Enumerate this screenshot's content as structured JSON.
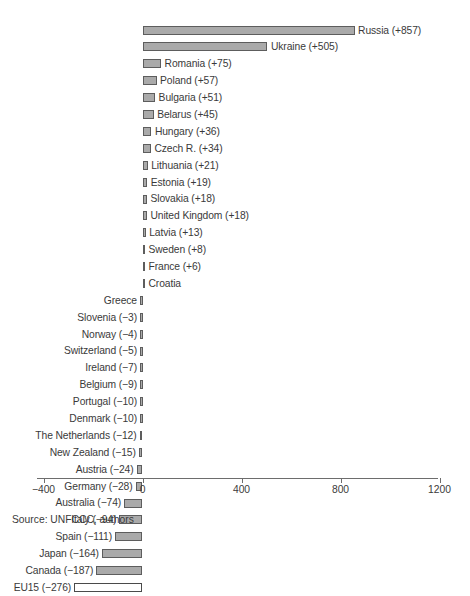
{
  "chart_data": {
    "type": "bar",
    "orientation": "horizontal",
    "title": "",
    "subtitle": "",
    "xlabel": "",
    "ylabel": "",
    "xlim": [
      -400,
      1200
    ],
    "xticks": [
      -400,
      0,
      400,
      800,
      1200
    ],
    "xtick_labels": [
      "−400",
      "0",
      "400",
      "800",
      "1200"
    ],
    "grid": false,
    "legend": null,
    "source_note": "Source: UNFCCC, authors",
    "zero_baseline": 0,
    "categories": [
      "Russia",
      "Ukraine",
      "Romania",
      "Poland",
      "Bulgaria",
      "Belarus",
      "Hungary",
      "Czech R.",
      "Lithuania",
      "Estonia",
      "Slovakia",
      "United Kingdom",
      "Latvia",
      "Sweden",
      "France",
      "Croatia",
      "Greece",
      "Slovenia",
      "Norway",
      "Switzerland",
      "Ireland",
      "Belgium",
      "Portugal",
      "Denmark",
      "The Netherlands",
      "New Zealand",
      "Austria",
      "Germany",
      "Australia",
      "Italy",
      "Spain",
      "Japan",
      "Canada",
      "EU15"
    ],
    "values": [
      857,
      505,
      75,
      57,
      51,
      45,
      36,
      34,
      21,
      19,
      18,
      18,
      13,
      8,
      6,
      2,
      -1,
      -3,
      -4,
      -5,
      -7,
      -9,
      -10,
      -10,
      -12,
      -15,
      -24,
      -28,
      -74,
      -94,
      -111,
      -164,
      -187,
      -276
    ],
    "bars": [
      {
        "name": "Russia",
        "value": 857,
        "label": "Russia (+857)",
        "side": "right",
        "style": "filled"
      },
      {
        "name": "Ukraine",
        "value": 505,
        "label": "Ukraine (+505)",
        "side": "right",
        "style": "filled"
      },
      {
        "name": "Romania",
        "value": 75,
        "label": "Romania (+75)",
        "side": "right",
        "style": "filled"
      },
      {
        "name": "Poland",
        "value": 57,
        "label": "Poland (+57)",
        "side": "right",
        "style": "filled"
      },
      {
        "name": "Bulgaria",
        "value": 51,
        "label": "Bulgaria (+51)",
        "side": "right",
        "style": "filled"
      },
      {
        "name": "Belarus",
        "value": 45,
        "label": "Belarus (+45)",
        "side": "right",
        "style": "filled"
      },
      {
        "name": "Hungary",
        "value": 36,
        "label": "Hungary (+36)",
        "side": "right",
        "style": "filled"
      },
      {
        "name": "Czech R.",
        "value": 34,
        "label": "Czech R. (+34)",
        "side": "right",
        "style": "filled"
      },
      {
        "name": "Lithuania",
        "value": 21,
        "label": "Lithuania (+21)",
        "side": "right",
        "style": "filled"
      },
      {
        "name": "Estonia",
        "value": 19,
        "label": "Estonia (+19)",
        "side": "right",
        "style": "filled"
      },
      {
        "name": "Slovakia",
        "value": 18,
        "label": "Slovakia (+18)",
        "side": "right",
        "style": "filled"
      },
      {
        "name": "United Kingdom",
        "value": 18,
        "label": "United Kingdom (+18)",
        "side": "right",
        "style": "filled"
      },
      {
        "name": "Latvia",
        "value": 13,
        "label": "Latvia (+13)",
        "side": "right",
        "style": "filled"
      },
      {
        "name": "Sweden",
        "value": 8,
        "label": "Sweden (+8)",
        "side": "right",
        "style": "filled"
      },
      {
        "name": "France",
        "value": 6,
        "label": "France (+6)",
        "side": "right",
        "style": "filled"
      },
      {
        "name": "Croatia",
        "value": 2,
        "label": "Croatia",
        "side": "right",
        "style": "filled"
      },
      {
        "name": "Greece",
        "value": -1,
        "label": "Greece",
        "side": "left",
        "style": "filled"
      },
      {
        "name": "Slovenia",
        "value": -3,
        "label": "Slovenia (−3)",
        "side": "left",
        "style": "filled"
      },
      {
        "name": "Norway",
        "value": -4,
        "label": "Norway (−4)",
        "side": "left",
        "style": "filled"
      },
      {
        "name": "Switzerland",
        "value": -5,
        "label": "Switzerland (−5)",
        "side": "left",
        "style": "filled"
      },
      {
        "name": "Ireland",
        "value": -7,
        "label": "Ireland (−7)",
        "side": "left",
        "style": "filled"
      },
      {
        "name": "Belgium",
        "value": -9,
        "label": "Belgium (−9)",
        "side": "left",
        "style": "filled"
      },
      {
        "name": "Portugal",
        "value": -10,
        "label": "Portugal (−10)",
        "side": "left",
        "style": "filled"
      },
      {
        "name": "Denmark",
        "value": -10,
        "label": "Denmark (−10)",
        "side": "left",
        "style": "filled"
      },
      {
        "name": "The Netherlands",
        "value": -12,
        "label": "The Netherlands (−12)",
        "side": "left",
        "style": "filled"
      },
      {
        "name": "New Zealand",
        "value": -15,
        "label": "New Zealand (−15)",
        "side": "left",
        "style": "filled"
      },
      {
        "name": "Austria",
        "value": -24,
        "label": "Austria (−24)",
        "side": "left",
        "style": "filled"
      },
      {
        "name": "Germany",
        "value": -28,
        "label": "Germany (−28)",
        "side": "left",
        "style": "filled"
      },
      {
        "name": "Australia",
        "value": -74,
        "label": "Australia (−74)",
        "side": "left",
        "style": "filled"
      },
      {
        "name": "Italy",
        "value": -94,
        "label": "Italy (−94)",
        "side": "left",
        "style": "filled"
      },
      {
        "name": "Spain",
        "value": -111,
        "label": "Spain (−111)",
        "side": "left",
        "style": "filled"
      },
      {
        "name": "Japan",
        "value": -164,
        "label": "Japan (−164)",
        "side": "left",
        "style": "filled"
      },
      {
        "name": "Canada",
        "value": -187,
        "label": "Canada (−187)",
        "side": "left",
        "style": "filled"
      },
      {
        "name": "EU15",
        "value": -276,
        "label": "EU15 (−276)",
        "side": "left",
        "style": "hollow"
      }
    ],
    "colors": {
      "bar_fill": "#aaaaaa",
      "bar_stroke": "#5d5d5d",
      "hollow_fill": "#ffffff",
      "hollow_stroke": "#4a4a4a",
      "axis": "#6d6d6d",
      "text": "#3a3a3a",
      "background": "#ffffff"
    }
  }
}
